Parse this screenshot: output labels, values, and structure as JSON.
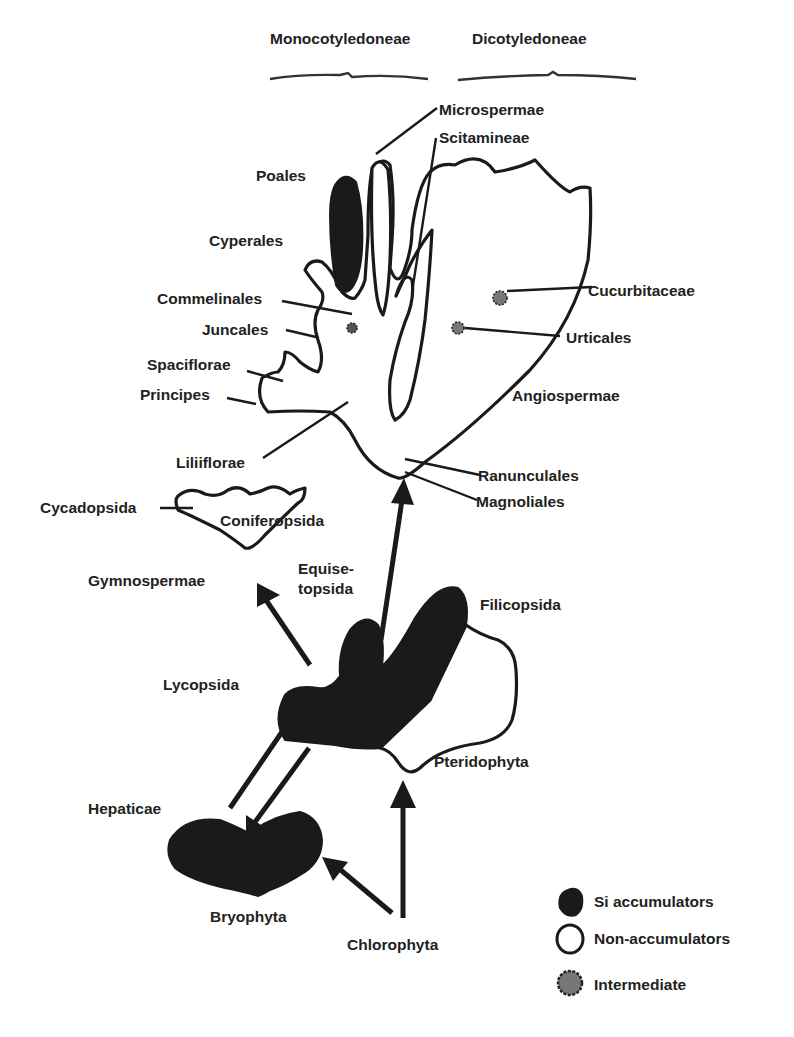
{
  "header": {
    "left_group": "Monocotyledoneae",
    "right_group": "Dicotyledoneae"
  },
  "labels": {
    "microspermae": "Microspermae",
    "scitamineae": "Scitamineae",
    "poales": "Poales",
    "cyperales": "Cyperales",
    "commelinales": "Commelinales",
    "juncales": "Juncales",
    "spaciflorae": "Spaciflorae",
    "principes": "Principes",
    "liliiflorae": "Liliiflorae",
    "cucurbitaceae": "Cucurbitaceae",
    "urticales": "Urticales",
    "angiospermae": "Angiospermae",
    "ranunculales": "Ranunculales",
    "magnoliales": "Magnoliales",
    "cycadopsida": "Cycadopsida",
    "coniferopsida": "Coniferopsida",
    "gymnospermae": "Gymnospermae",
    "equisetopsida_1": "Equise-",
    "equisetopsida_2": "topsida",
    "filicopsida": "Filicopsida",
    "lycopsida": "Lycopsida",
    "pteridophyta": "Pteridophyta",
    "hepaticae": "Hepaticae",
    "bryophyta": "Bryophyta",
    "chlorophyta": "Chlorophyta"
  },
  "legend": {
    "items": [
      {
        "label": "Si accumulators",
        "symbol": "filled-blob",
        "color": "#1a1a1a"
      },
      {
        "label": "Non-accumulators",
        "symbol": "outline-blob",
        "color": "#ffffff"
      },
      {
        "label": "Intermediate",
        "symbol": "stippled-blob",
        "color": "#777777"
      }
    ]
  },
  "colors": {
    "ink": "#1a1a1a",
    "background": "#ffffff",
    "intermediate": "#777777"
  }
}
